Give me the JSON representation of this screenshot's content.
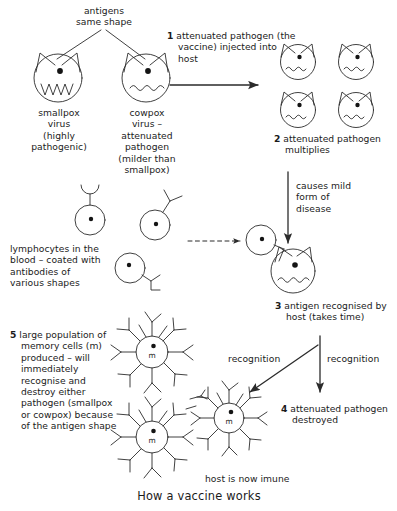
{
  "figure": {
    "caption": "How a vaccine works",
    "stroke_color": "#2b2b2b",
    "text_color": "#1b1b1b",
    "background": "#ffffff"
  },
  "labels": {
    "antigens_same_shape": "antigens\nsame shape",
    "smallpox": "smallpox\nvirus\n(highly\npathogenic)",
    "cowpox": "cowpox\nvirus –\nattenuated\npathogen\n(milder than\nsmallpox)",
    "lymphocytes": "lymphocytes in the\nblood – coated with\nantibodies of\nvarious shapes",
    "causes_mild": "causes mild\nform of\ndisease",
    "recognition_left": "recognition",
    "recognition_right": "recognition",
    "host_immune": "host is now imune",
    "memory_cell_letter": "m"
  },
  "steps": [
    {
      "number": "1",
      "text": "attenuated pathogen\n(the vaccine)\ninjected into host"
    },
    {
      "number": "2",
      "text": "attenuated pathogen\nmultiplies"
    },
    {
      "number": "3",
      "text": "antigen recognised\nby host (takes time)"
    },
    {
      "number": "4",
      "text": "attenuated pathogen\ndestroyed"
    },
    {
      "number": "5",
      "text": "large population of\nmemory cells (m)\nproduced – will\nimmediately\nrecognise and\ndestroy either\npathogen\n(smallpox or\ncowpox) because\nof the antigen\nshape"
    }
  ]
}
